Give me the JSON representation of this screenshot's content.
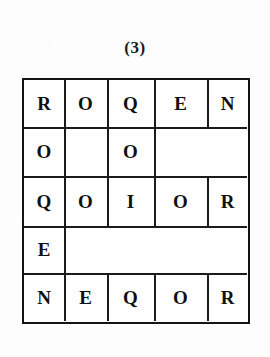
{
  "figure": {
    "caption": "(3)",
    "ink_color": "#141414",
    "paper_color": "#fdfdfd"
  },
  "grid": {
    "columns": 5,
    "rows": 5,
    "cells": [
      [
        {
          "text": "R",
          "span": 1
        },
        {
          "text": "O",
          "span": 1
        },
        {
          "text": "Q",
          "span": 1
        },
        {
          "text": "E",
          "span": 1
        },
        {
          "text": "N",
          "span": 1
        }
      ],
      [
        {
          "text": "O",
          "span": 1
        },
        {
          "text": "",
          "span": 1
        },
        {
          "text": "O",
          "span": 1
        },
        {
          "text": "",
          "span": 2
        }
      ],
      [
        {
          "text": "Q",
          "span": 1
        },
        {
          "text": "O",
          "span": 1
        },
        {
          "text": "I",
          "span": 1
        },
        {
          "text": "O",
          "span": 1
        },
        {
          "text": "R",
          "span": 1
        }
      ],
      [
        {
          "text": "E",
          "span": 1
        },
        {
          "text": "",
          "span": 4
        }
      ],
      [
        {
          "text": "N",
          "span": 1
        },
        {
          "text": "E",
          "span": 1
        },
        {
          "text": "Q",
          "span": 1
        },
        {
          "text": "O",
          "span": 1
        },
        {
          "text": "R",
          "span": 1
        }
      ]
    ]
  }
}
